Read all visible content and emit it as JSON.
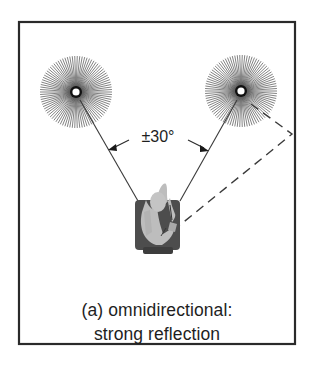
{
  "figure": {
    "angle_label": "±30°",
    "caption_lines": [
      "(a) omnidirectional:",
      "strong reflection"
    ],
    "elements": {
      "room_boundary": "rectangular room wall outline",
      "left_speaker": "omnidirectional-speaker",
      "right_speaker": "omnidirectional-speaker",
      "listener": "listener seen from above, seated in chair",
      "direct_paths": 2,
      "reflection_path": "dashed line from right speaker off right wall to listener"
    },
    "colors": {
      "frame": "#2a2a2a",
      "speaker_rays": "#555555",
      "speaker_core": "#111111",
      "lines": "#3a3a3a",
      "chair": "#4a4a4a",
      "person": "#b8b8b8",
      "text": "#1e1e1e"
    }
  }
}
